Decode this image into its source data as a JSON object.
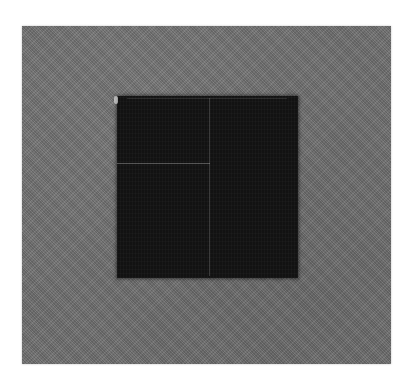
{
  "image": {
    "description": "Textured gray panel with a dark square patch in the center",
    "colors": {
      "page_background": "#ffffff",
      "panel_gray": "#6f6f6f",
      "dark_square": "#121212",
      "faint_lines": "#c8c8c8"
    },
    "shapes": {
      "outer_panel": {
        "x": 22,
        "y": 26,
        "width": 369,
        "height": 338
      },
      "dark_square": {
        "x": 117,
        "y": 96,
        "width": 181,
        "height": 182
      },
      "vertical_line_x": 209,
      "horizontal_line_y": 163
    }
  }
}
